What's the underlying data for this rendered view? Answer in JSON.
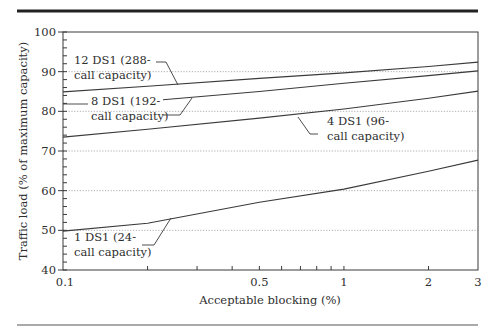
{
  "chart_data": {
    "type": "line",
    "title": "",
    "xlabel": "Acceptable blocking (%)",
    "ylabel": "Traffic load (% of maximum capacity)",
    "xscale": "log",
    "xlim": [
      0.1,
      3
    ],
    "ylim": [
      40,
      100
    ],
    "x_ticks": [
      0.1,
      0.5,
      1,
      2,
      3
    ],
    "x_tick_labels": [
      "0.1",
      "0.5",
      "1",
      "2",
      "3"
    ],
    "x_minor_ticks": [
      0.2,
      0.3,
      0.4,
      0.6,
      0.7,
      0.8,
      0.9
    ],
    "y_ticks": [
      40,
      50,
      60,
      70,
      80,
      90,
      100
    ],
    "y_tick_labels": [
      "40",
      "50",
      "60",
      "70",
      "80",
      "90",
      "100"
    ],
    "grid": "horizontal dotted at y ticks",
    "legend": "inline labels with leader lines",
    "series": [
      {
        "name": "12 DS1 (288-call capacity)",
        "label_lines": [
          "12 DS1 (288-",
          "call capacity)"
        ],
        "x": [
          0.1,
          0.2,
          0.5,
          1,
          2,
          3
        ],
        "values": [
          84.9,
          86.3,
          88.3,
          89.7,
          91.3,
          92.4
        ]
      },
      {
        "name": "8 DS1 (192-call capacity)",
        "label_lines": [
          "8 DS1 (192-",
          "call capacity)"
        ],
        "x": [
          0.227,
          0.5,
          1,
          2,
          3
        ],
        "values": [
          82.9,
          85.0,
          87.1,
          89.0,
          90.2
        ]
      },
      {
        "name": "4 DS1 (96-call capacity)",
        "label_lines": [
          "4 DS1 (96-",
          "call capacity)"
        ],
        "x": [
          0.1,
          0.2,
          0.5,
          1,
          2,
          3
        ],
        "values": [
          73.5,
          75.5,
          78.3,
          80.6,
          83.3,
          85.1
        ]
      },
      {
        "name": "1 DS1 (24-call capacity)",
        "label_lines": [
          "1 DS1 (24-",
          "call capacity)"
        ],
        "x": [
          0.1,
          0.2,
          0.5,
          1,
          2,
          3
        ],
        "values": [
          49.8,
          51.8,
          57.1,
          60.4,
          64.9,
          67.7
        ]
      }
    ]
  },
  "style": {
    "line_color": "#3a3a3a",
    "grid_color": "#9a9a9a",
    "rule_color": "#222222"
  }
}
